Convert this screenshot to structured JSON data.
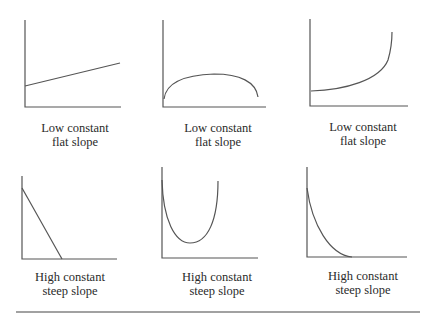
{
  "panels": [
    {
      "id": "p1",
      "line1": "Low constant",
      "line2": "flat slope",
      "curve": "linear-rising-gentle"
    },
    {
      "id": "p2",
      "line1": "Low constant",
      "line2": "flat slope",
      "curve": "arch"
    },
    {
      "id": "p3",
      "line1": "Low constant",
      "line2": "flat slope",
      "curve": "exponential-rising"
    },
    {
      "id": "p4",
      "line1": "High constant",
      "line2": "steep slope",
      "curve": "linear-falling-steep"
    },
    {
      "id": "p5",
      "line1": "High constant",
      "line2": "steep slope",
      "curve": "u-shape"
    },
    {
      "id": "p6",
      "line1": "High constant",
      "line2": "steep slope",
      "curve": "exponential-decay"
    }
  ],
  "colors": {
    "axis": "#555555",
    "curve": "#555555",
    "text": "#2a2a2a",
    "rule": "#444444"
  }
}
